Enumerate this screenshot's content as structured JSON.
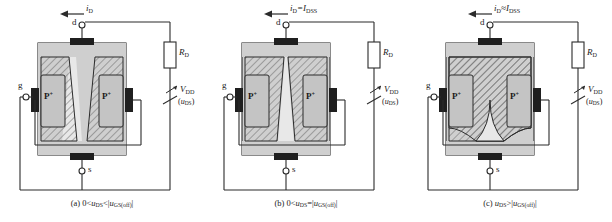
{
  "figure": {
    "type": "jfet-operation-diagram",
    "panel_count": 3,
    "colors": {
      "line": "#2b2b2b",
      "substrate": "#cfcfcf",
      "channel": "#e8e8e8",
      "gate_region": "#c4c4c4",
      "contact": "#1f1f1f",
      "hatch": "#6e6e6e",
      "background": "#ffffff"
    }
  },
  "panels": [
    {
      "id": "a",
      "caption_letter": "(a)",
      "caption_expr_head": "0<",
      "caption_u": "u",
      "caption_sub1": "DS",
      "caption_rel": "<|",
      "caption_u2": "u",
      "caption_sub2": "GS(off)",
      "caption_tail": "|",
      "current_label": {
        "i": "i",
        "i_sub": "D",
        "eq": "",
        "eq_sub": ""
      },
      "drain_terminal": "d",
      "source_terminal": "s",
      "gate_terminal": "g",
      "gate_region_left": {
        "p": "P",
        "plus": "+"
      },
      "gate_region_right": {
        "p": "P",
        "plus": "+"
      },
      "resistor_label": {
        "r": "R",
        "r_sub": "D"
      },
      "supply_label": {
        "v": "V",
        "v_sub": "DD"
      },
      "supply_sub_label": {
        "open": "(",
        "u": "u",
        "u_sub": "DS",
        "close": ")"
      },
      "channel_state": "open-wide",
      "channel_note": "channel partially narrowed, tapered toward drain"
    },
    {
      "id": "b",
      "caption_letter": "(b)",
      "caption_expr_head": "0<",
      "caption_u": "u",
      "caption_sub1": "DS",
      "caption_rel": "=|",
      "caption_u2": "u",
      "caption_sub2": "GS(off)",
      "caption_tail": "|",
      "current_label": {
        "i": "i",
        "i_sub": "D",
        "eq": "=I",
        "eq_sub": "DSS"
      },
      "drain_terminal": "d",
      "source_terminal": "s",
      "gate_terminal": "g",
      "gate_region_left": {
        "p": "P",
        "plus": "+"
      },
      "gate_region_right": {
        "p": "P",
        "plus": "+"
      },
      "resistor_label": {
        "r": "R",
        "r_sub": "D"
      },
      "supply_label": {
        "v": "V",
        "v_sub": "DD"
      },
      "supply_sub_label": {
        "open": "(",
        "u": "u",
        "u_sub": "DS",
        "close": ")"
      },
      "channel_state": "pinch-point",
      "channel_note": "channel pinched to a point at the drain end"
    },
    {
      "id": "c",
      "caption_letter": "(c)",
      "caption_expr_head": "",
      "caption_u": "u",
      "caption_sub1": "DS",
      "caption_rel": ">|",
      "caption_u2": "u",
      "caption_sub2": "GS(off)",
      "caption_tail": "|",
      "current_label": {
        "i": "i",
        "i_sub": "D",
        "eq": "≈I",
        "eq_sub": "DSS"
      },
      "drain_terminal": "d",
      "source_terminal": "s",
      "gate_terminal": "g",
      "gate_region_left": {
        "p": "P",
        "plus": "+"
      },
      "gate_region_right": {
        "p": "P",
        "plus": "+"
      },
      "resistor_label": {
        "r": "R",
        "r_sub": "D"
      },
      "supply_label": {
        "v": "V",
        "v_sub": "DD"
      },
      "supply_sub_label": {
        "open": "(",
        "u": "u",
        "u_sub": "DS",
        "close": ")"
      },
      "channel_state": "pinched-off",
      "channel_note": "depletion regions merged, pinch-off region extended"
    }
  ]
}
